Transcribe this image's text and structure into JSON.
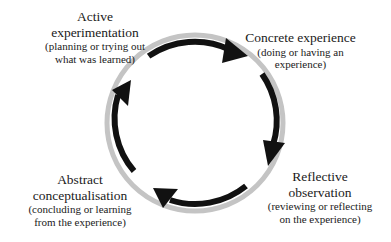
{
  "diagram": {
    "colors": {
      "ring": "#c4c4c4",
      "arrow": "#111111",
      "text": "#1a1a1a",
      "background": "#ffffff"
    },
    "stages": [
      {
        "id": "concrete-experience",
        "title": "Concrete experience",
        "desc_lines": [
          "(doing or having an",
          "experience)"
        ]
      },
      {
        "id": "reflective-observation",
        "title_lines": [
          "Reflective",
          "observation"
        ],
        "desc_lines": [
          "(reviewing or reflecting",
          "on the experience)"
        ]
      },
      {
        "id": "abstract-conceptualisation",
        "title_lines": [
          "Abstract",
          "conceptualisation"
        ],
        "desc_lines": [
          "(concluding or learning",
          "from the experience)"
        ]
      },
      {
        "id": "active-experimentation",
        "title_lines": [
          "Active",
          "experimentation"
        ],
        "desc_lines": [
          "(planning or trying out",
          "what was learned)"
        ]
      }
    ],
    "flow": "clockwise"
  }
}
